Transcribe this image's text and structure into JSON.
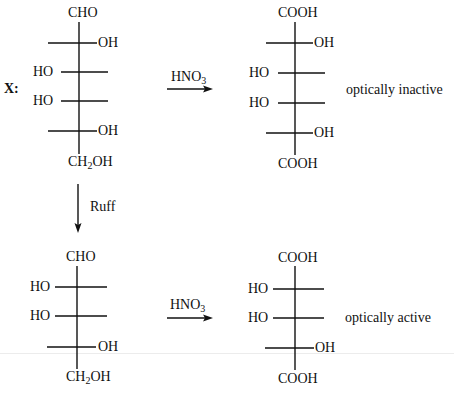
{
  "compound_label": "X:",
  "reagent_oxidation": "HNO",
  "reagent_oxidation_sub": "3",
  "reagent_degradation": "Ruff",
  "top_left": {
    "top": "CHO",
    "rows": [
      {
        "left": "",
        "right": "OH"
      },
      {
        "left": "HO",
        "right": ""
      },
      {
        "left": "HO",
        "right": ""
      },
      {
        "left": "",
        "right": "OH"
      }
    ],
    "bottom_main": "CH",
    "bottom_sub": "2",
    "bottom_rest": "OH"
  },
  "top_right": {
    "top": "COOH",
    "rows": [
      {
        "left": "",
        "right": "OH"
      },
      {
        "left": "HO",
        "right": ""
      },
      {
        "left": "HO",
        "right": ""
      },
      {
        "left": "",
        "right": "OH"
      }
    ],
    "bottom": "COOH",
    "activity": "optically inactive"
  },
  "bottom_left": {
    "top": "CHO",
    "rows": [
      {
        "left": "HO",
        "right": ""
      },
      {
        "left": "HO",
        "right": ""
      },
      {
        "left": "",
        "right": "OH"
      }
    ],
    "bottom_main": "CH",
    "bottom_sub": "2",
    "bottom_rest": "OH"
  },
  "bottom_right": {
    "top": "COOH",
    "rows": [
      {
        "left": "HO",
        "right": ""
      },
      {
        "left": "HO",
        "right": ""
      },
      {
        "left": "",
        "right": "OH"
      }
    ],
    "bottom": "COOH",
    "activity": "optically active"
  }
}
